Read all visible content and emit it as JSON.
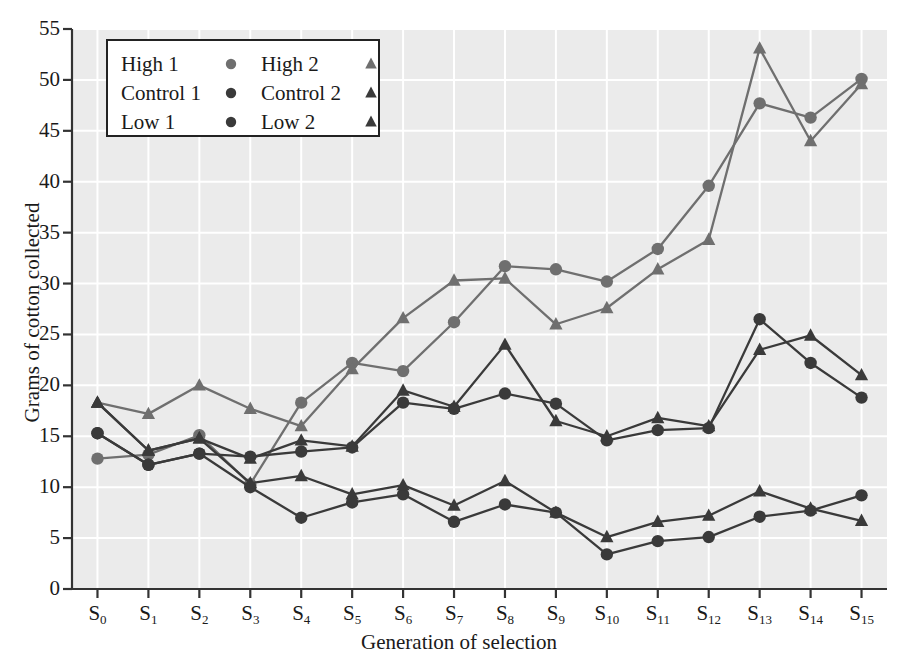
{
  "chart_data": {
    "type": "line",
    "title": "",
    "xlabel": "Generation of selection",
    "ylabel": "Grams of cotton collected",
    "categories": [
      "S0",
      "S1",
      "S2",
      "S3",
      "S4",
      "S5",
      "S6",
      "S7",
      "S8",
      "S9",
      "S10",
      "S11",
      "S12",
      "S13",
      "S14",
      "S15"
    ],
    "tick_labels_x": [
      "S₀",
      "S₁",
      "S₂",
      "S₃",
      "S₄",
      "S₅",
      "S₆",
      "S₇",
      "S₈",
      "S₉",
      "S₁₀",
      "S₁₁",
      "S₁₂",
      "S₁₃",
      "S₁₄",
      "S₁₅"
    ],
    "tick_labels_y": [
      "0",
      "5",
      "10",
      "15",
      "20",
      "25",
      "30",
      "35",
      "40",
      "45",
      "50",
      "55"
    ],
    "ylim": [
      0,
      55
    ],
    "ytick_step": 5,
    "grid": true,
    "grid_color": "#ffffff",
    "plot_background": "#ebebeb",
    "legend_position": "top-left",
    "series": [
      {
        "name": "High 1",
        "marker": "circle",
        "color": "#6f6f6f",
        "values": [
          12.8,
          13.2,
          15.1,
          10.3,
          18.3,
          22.2,
          21.4,
          26.2,
          31.7,
          31.4,
          30.2,
          33.4,
          39.6,
          47.7,
          46.3,
          50.1
        ]
      },
      {
        "name": "High 2",
        "marker": "triangle",
        "color": "#6f6f6f",
        "values": [
          18.3,
          17.2,
          20.0,
          17.7,
          16.0,
          21.6,
          26.6,
          30.3,
          30.5,
          26.0,
          27.6,
          31.4,
          34.3,
          53.1,
          44.0,
          49.6
        ]
      },
      {
        "name": "Control 1",
        "marker": "circle",
        "color": "#3a3a3a",
        "values": [
          15.3,
          12.2,
          13.3,
          13.0,
          13.5,
          13.9,
          18.3,
          17.7,
          19.2,
          18.2,
          14.6,
          15.6,
          15.8,
          26.5,
          22.2,
          18.8
        ]
      },
      {
        "name": "Control 2",
        "marker": "triangle",
        "color": "#3a3a3a",
        "values": [
          18.3,
          13.6,
          14.8,
          12.8,
          14.6,
          14.0,
          19.5,
          17.9,
          24.0,
          16.5,
          15.0,
          16.8,
          16.0,
          23.5,
          24.9,
          21.0
        ]
      },
      {
        "name": "Low 1",
        "marker": "circle",
        "color": "#3a3a3a",
        "values": [
          15.3,
          12.2,
          13.3,
          10.0,
          7.0,
          8.5,
          9.3,
          6.6,
          8.3,
          7.5,
          3.4,
          4.7,
          5.1,
          7.1,
          7.7,
          9.2
        ]
      },
      {
        "name": "Low 2",
        "marker": "triangle",
        "color": "#3a3a3a",
        "values": [
          18.3,
          13.6,
          14.8,
          10.4,
          11.1,
          9.3,
          10.2,
          8.2,
          10.6,
          7.5,
          5.1,
          6.6,
          7.2,
          9.6,
          7.9,
          6.7
        ]
      }
    ],
    "legend": [
      {
        "label": "High 1",
        "marker": "circle",
        "color": "#6f6f6f"
      },
      {
        "label": "High 2",
        "marker": "triangle",
        "color": "#6f6f6f"
      },
      {
        "label": "Control 1",
        "marker": "circle",
        "color": "#3a3a3a"
      },
      {
        "label": "Control 2",
        "marker": "triangle",
        "color": "#3a3a3a"
      },
      {
        "label": "Low 1",
        "marker": "circle",
        "color": "#3a3a3a"
      },
      {
        "label": "Low 2",
        "marker": "triangle",
        "color": "#3a3a3a"
      }
    ]
  }
}
